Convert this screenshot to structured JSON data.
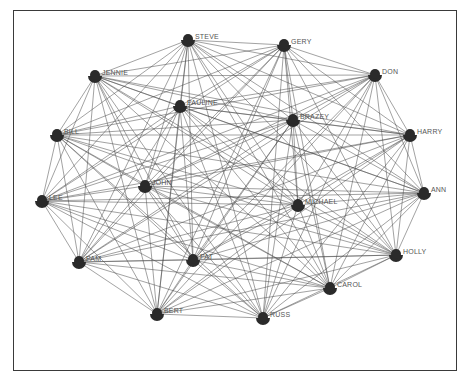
{
  "diagram": {
    "type": "network",
    "title": "",
    "node_color": "#2a2a2a",
    "edge_color": "#4a4a4a",
    "nodes": [
      {
        "id": "STEVE",
        "label": "STEVE",
        "x": 188,
        "y": 40
      },
      {
        "id": "GERY",
        "label": "GERY",
        "x": 284,
        "y": 45
      },
      {
        "id": "JENNIE",
        "label": "JENNIE",
        "x": 95,
        "y": 76
      },
      {
        "id": "DON",
        "label": "DON",
        "x": 375,
        "y": 75
      },
      {
        "id": "PAULINE",
        "label": "PAULINE",
        "x": 180,
        "y": 106
      },
      {
        "id": "BRAZEY",
        "label": "BRAZEY",
        "x": 293,
        "y": 120
      },
      {
        "id": "BILL",
        "label": "BILL",
        "x": 57,
        "y": 135
      },
      {
        "id": "HARRY",
        "label": "HARRY",
        "x": 410,
        "y": 135
      },
      {
        "id": "JOHN",
        "label": "JOHN",
        "x": 145,
        "y": 186
      },
      {
        "id": "LEE",
        "label": "LEE",
        "x": 42,
        "y": 201
      },
      {
        "id": "MICHAEL",
        "label": "MICHAEL",
        "x": 298,
        "y": 205
      },
      {
        "id": "ANN",
        "label": "ANN",
        "x": 424,
        "y": 193
      },
      {
        "id": "PAM",
        "label": "PAM",
        "x": 79,
        "y": 262
      },
      {
        "id": "PAT",
        "label": "PAT",
        "x": 193,
        "y": 260
      },
      {
        "id": "HOLLY",
        "label": "HOLLY",
        "x": 396,
        "y": 255
      },
      {
        "id": "CAROL",
        "label": "CAROL",
        "x": 330,
        "y": 288
      },
      {
        "id": "BERT",
        "label": "BERT",
        "x": 157,
        "y": 314
      },
      {
        "id": "RUSS",
        "label": "RUSS",
        "x": 263,
        "y": 318
      }
    ],
    "edges_note": "dense near-complete graph"
  }
}
